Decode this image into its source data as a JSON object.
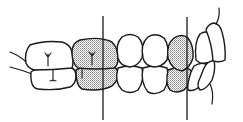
{
  "diagram": {
    "title": "Dental occlusion lateral view",
    "colors": {
      "line": "#1a1a1a",
      "background": "#ffffff",
      "shading": "#9a9a9a"
    },
    "reference_lines": [
      {
        "id": "line-1",
        "x": 103,
        "y1": 16,
        "y2": 120
      },
      {
        "id": "line-2",
        "x": 187,
        "y1": 17,
        "y2": 120
      }
    ],
    "shaded_regions": [
      "first-molar",
      "canine"
    ]
  }
}
